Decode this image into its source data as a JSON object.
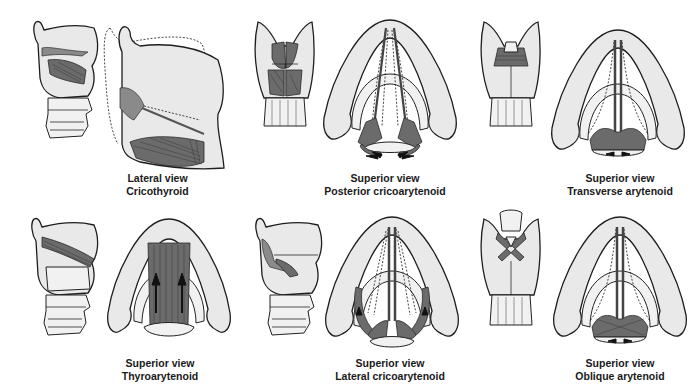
{
  "figure": {
    "panels": [
      {
        "id": "cricothyroid",
        "view": "Lateral view",
        "muscle": "Cricothyroid"
      },
      {
        "id": "posterior-cricoarytenoid",
        "view": "Superior view",
        "muscle": "Posterior cricoarytenoid"
      },
      {
        "id": "transverse-arytenoid",
        "view": "Superior view",
        "muscle": "Transverse arytenoid"
      },
      {
        "id": "thyroarytenoid",
        "view": "Superior view",
        "muscle": "Thyroarytenoid"
      },
      {
        "id": "lateral-cricoarytenoid",
        "view": "Superior view",
        "muscle": "Lateral cricoarytenoid"
      },
      {
        "id": "oblique-arytenoid",
        "view": "Superior view",
        "muscle": "Oblique arytenoid"
      }
    ],
    "colors": {
      "background": "#ffffff",
      "cartilage_fill": "#e9e9e9",
      "muscle_fill": "#6b6b6b",
      "outline": "#1e1e1e",
      "caption_text": "#1a1a1a"
    }
  }
}
